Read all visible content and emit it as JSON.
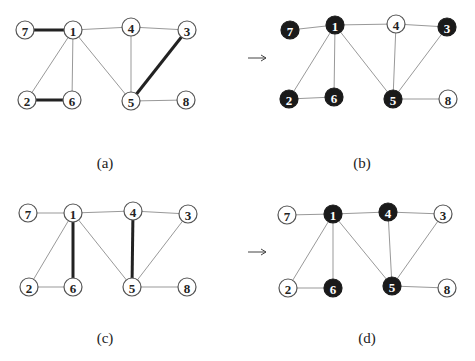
{
  "figure": {
    "panels": [
      {
        "id": "a",
        "caption": "(a)",
        "caption_pos": [
          105,
          168
        ],
        "nodes": [
          {
            "id": "7",
            "x": 25,
            "y": 30,
            "filled": false
          },
          {
            "id": "1",
            "x": 73,
            "y": 30,
            "filled": false
          },
          {
            "id": "4",
            "x": 131,
            "y": 27,
            "filled": false
          },
          {
            "id": "3",
            "x": 187,
            "y": 30,
            "filled": false
          },
          {
            "id": "2",
            "x": 27,
            "y": 100,
            "filled": false
          },
          {
            "id": "6",
            "x": 72,
            "y": 100,
            "filled": false
          },
          {
            "id": "5",
            "x": 131,
            "y": 101,
            "filled": false
          },
          {
            "id": "8",
            "x": 186,
            "y": 100,
            "filled": false
          }
        ],
        "edges": [
          {
            "from": "7",
            "to": "1",
            "bold": true
          },
          {
            "from": "1",
            "to": "4",
            "bold": false
          },
          {
            "from": "4",
            "to": "3",
            "bold": false
          },
          {
            "from": "1",
            "to": "2",
            "bold": false
          },
          {
            "from": "1",
            "to": "6",
            "bold": false
          },
          {
            "from": "1",
            "to": "5",
            "bold": false
          },
          {
            "from": "4",
            "to": "5",
            "bold": false
          },
          {
            "from": "3",
            "to": "5",
            "bold": true
          },
          {
            "from": "2",
            "to": "6",
            "bold": true
          },
          {
            "from": "5",
            "to": "8",
            "bold": false
          }
        ]
      },
      {
        "id": "b",
        "caption": "(b)",
        "caption_pos": [
          362,
          168
        ],
        "nodes": [
          {
            "id": "7",
            "x": 290,
            "y": 30,
            "filled": true
          },
          {
            "id": "1",
            "x": 335,
            "y": 25,
            "filled": true
          },
          {
            "id": "4",
            "x": 396,
            "y": 24,
            "filled": false
          },
          {
            "id": "3",
            "x": 447,
            "y": 27,
            "filled": true
          },
          {
            "id": "2",
            "x": 289,
            "y": 99,
            "filled": true
          },
          {
            "id": "6",
            "x": 334,
            "y": 97,
            "filled": true
          },
          {
            "id": "5",
            "x": 393,
            "y": 99,
            "filled": true
          },
          {
            "id": "8",
            "x": 448,
            "y": 99,
            "filled": false
          }
        ],
        "edges": [
          {
            "from": "7",
            "to": "1",
            "bold": false
          },
          {
            "from": "1",
            "to": "4",
            "bold": false
          },
          {
            "from": "4",
            "to": "3",
            "bold": false
          },
          {
            "from": "1",
            "to": "2",
            "bold": false
          },
          {
            "from": "1",
            "to": "6",
            "bold": false
          },
          {
            "from": "1",
            "to": "5",
            "bold": false
          },
          {
            "from": "4",
            "to": "5",
            "bold": false
          },
          {
            "from": "3",
            "to": "5",
            "bold": false
          },
          {
            "from": "2",
            "to": "6",
            "bold": false
          },
          {
            "from": "5",
            "to": "8",
            "bold": false
          }
        ]
      },
      {
        "id": "c",
        "caption": "(c)",
        "caption_pos": [
          105,
          343
        ],
        "nodes": [
          {
            "id": "7",
            "x": 28,
            "y": 213,
            "filled": false
          },
          {
            "id": "1",
            "x": 73,
            "y": 213,
            "filled": false
          },
          {
            "id": "4",
            "x": 133,
            "y": 211,
            "filled": false
          },
          {
            "id": "3",
            "x": 188,
            "y": 214,
            "filled": false
          },
          {
            "id": "2",
            "x": 29,
            "y": 287,
            "filled": false
          },
          {
            "id": "6",
            "x": 73,
            "y": 287,
            "filled": false
          },
          {
            "id": "5",
            "x": 132,
            "y": 287,
            "filled": false
          },
          {
            "id": "8",
            "x": 187,
            "y": 287,
            "filled": false
          }
        ],
        "edges": [
          {
            "from": "7",
            "to": "1",
            "bold": false
          },
          {
            "from": "1",
            "to": "4",
            "bold": false
          },
          {
            "from": "4",
            "to": "3",
            "bold": false
          },
          {
            "from": "1",
            "to": "2",
            "bold": false
          },
          {
            "from": "1",
            "to": "6",
            "bold": true
          },
          {
            "from": "1",
            "to": "5",
            "bold": false
          },
          {
            "from": "4",
            "to": "5",
            "bold": true
          },
          {
            "from": "3",
            "to": "5",
            "bold": false
          },
          {
            "from": "2",
            "to": "6",
            "bold": false
          },
          {
            "from": "5",
            "to": "8",
            "bold": false
          }
        ]
      },
      {
        "id": "d",
        "caption": "(d)",
        "caption_pos": [
          367,
          343
        ],
        "nodes": [
          {
            "id": "7",
            "x": 287,
            "y": 215,
            "filled": false
          },
          {
            "id": "1",
            "x": 333,
            "y": 214,
            "filled": true
          },
          {
            "id": "4",
            "x": 388,
            "y": 212,
            "filled": true
          },
          {
            "id": "3",
            "x": 443,
            "y": 214,
            "filled": false
          },
          {
            "id": "2",
            "x": 288,
            "y": 288,
            "filled": false
          },
          {
            "id": "6",
            "x": 333,
            "y": 288,
            "filled": true
          },
          {
            "id": "5",
            "x": 392,
            "y": 286,
            "filled": true
          },
          {
            "id": "8",
            "x": 447,
            "y": 288,
            "filled": false
          }
        ],
        "edges": [
          {
            "from": "7",
            "to": "1",
            "bold": false
          },
          {
            "from": "1",
            "to": "4",
            "bold": false
          },
          {
            "from": "4",
            "to": "3",
            "bold": false
          },
          {
            "from": "1",
            "to": "2",
            "bold": false
          },
          {
            "from": "1",
            "to": "6",
            "bold": false
          },
          {
            "from": "1",
            "to": "5",
            "bold": false
          },
          {
            "from": "4",
            "to": "5",
            "bold": false
          },
          {
            "from": "3",
            "to": "5",
            "bold": false
          },
          {
            "from": "2",
            "to": "6",
            "bold": false
          },
          {
            "from": "5",
            "to": "8",
            "bold": false
          }
        ]
      }
    ],
    "arrows": [
      {
        "x1": 248,
        "y1": 58,
        "x2": 266,
        "y2": 58
      },
      {
        "x1": 248,
        "y1": 252,
        "x2": 266,
        "y2": 252
      }
    ],
    "node_radius": 9
  }
}
